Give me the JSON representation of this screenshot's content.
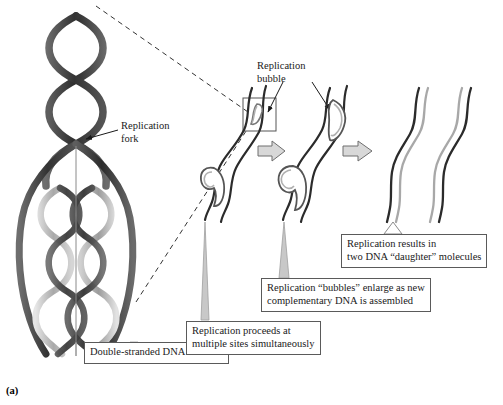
{
  "figure": {
    "panel_letter": "(a)",
    "background_color": "#ffffff"
  },
  "colors": {
    "parental_strand_dark": "#3a3a3a",
    "parental_strand_darker": "#2b2b2b",
    "new_strand_light": "#b9b9b9",
    "new_strand_mid": "#9a9a9a",
    "outline": "#222222",
    "caption_border": "#5a5a5a",
    "caption_text": "#1a1a1a",
    "arrow_fill": "#d8d8d8",
    "arrow_stroke": "#6e6e6e",
    "dashed_guide": "#333333",
    "leader_line": "#9a9a9a"
  },
  "labels": {
    "replication_fork": "Replication\nfork",
    "replication_bubble": "Replication\nbubble"
  },
  "captions": [
    {
      "id": "unwinds",
      "text": "Double-stranded DNA unwinds"
    },
    {
      "id": "multiple_sites",
      "text": "Replication proceeds at\nmultiple sites simultaneously"
    },
    {
      "id": "bubbles_enlarge",
      "text": "Replication “bubbles” enlarge as new\ncomplementary DNA is assembled"
    },
    {
      "id": "daughter_molecules",
      "text": "Replication results in\ntwo DNA “daughter” molecules"
    }
  ],
  "stages": [
    {
      "index": 1,
      "name": "replication-begins",
      "description": "Strand with two small replication bubbles forming at multiple sites"
    },
    {
      "index": 2,
      "name": "bubbles-enlarge",
      "description": "Strand with enlarged replication bubbles containing new complementary DNA"
    },
    {
      "index": 3,
      "name": "daughter-molecules",
      "description": "Two separated daughter DNA molecules, each one parental and one new strand"
    }
  ],
  "annotations": {
    "detail_box": "Square callout around first replication bubble",
    "dashed_guides": 2,
    "stage_arrows": 2
  }
}
